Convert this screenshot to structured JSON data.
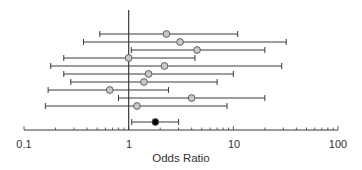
{
  "chart_data": {
    "type": "forest",
    "title": "",
    "xlabel": "Odds Ratio",
    "ylabel": "",
    "xscale": "log",
    "xlim": [
      0.1,
      100
    ],
    "xticks_major": [
      0.1,
      1,
      10,
      100
    ],
    "xtick_labels": [
      "0.1",
      "1",
      "10",
      "100"
    ],
    "reference_line": 1,
    "grid": false,
    "legend": null,
    "studies": [
      {
        "or": 2.3,
        "ci_low": 0.53,
        "ci_high": 11.0,
        "marker": "open-gray"
      },
      {
        "or": 3.1,
        "ci_low": 0.37,
        "ci_high": 32.0,
        "marker": "open-gray"
      },
      {
        "or": 4.5,
        "ci_low": 1.06,
        "ci_high": 20.0,
        "marker": "open-gray"
      },
      {
        "or": 1.0,
        "ci_low": 0.24,
        "ci_high": 4.3,
        "marker": "open-gray"
      },
      {
        "or": 2.2,
        "ci_low": 0.18,
        "ci_high": 29.0,
        "marker": "open-gray"
      },
      {
        "or": 1.55,
        "ci_low": 0.24,
        "ci_high": 10.0,
        "marker": "open-gray"
      },
      {
        "or": 1.4,
        "ci_low": 0.28,
        "ci_high": 7.0,
        "marker": "open-gray"
      },
      {
        "or": 0.66,
        "ci_low": 0.17,
        "ci_high": 2.4,
        "marker": "open-gray"
      },
      {
        "or": 4.0,
        "ci_low": 0.8,
        "ci_high": 20.0,
        "marker": "open-gray"
      },
      {
        "or": 1.2,
        "ci_low": 0.16,
        "ci_high": 8.7,
        "marker": "open-gray"
      }
    ],
    "summary": {
      "or": 1.8,
      "ci_low": 1.07,
      "ci_high": 3.0,
      "marker": "filled-black"
    }
  },
  "axis": {
    "tick_labels": [
      "0.1",
      "1",
      "10",
      "100"
    ]
  },
  "labels": {
    "xlabel": "Odds Ratio"
  },
  "colors": {
    "line": "#3a3a3a",
    "study_marker_fill": "#c8c8c8",
    "summary_marker_fill": "#000000"
  }
}
